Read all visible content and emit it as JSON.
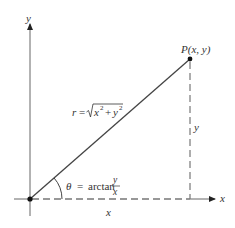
{
  "diagram": {
    "axes": {
      "x_label": "x",
      "y_label": "y"
    },
    "point": {
      "label": "P(x, y)"
    },
    "radius": {
      "lhs": "r",
      "eq": "=",
      "radicand_x": "x",
      "radicand_y": "y",
      "plus": "+",
      "exp": "2"
    },
    "angle": {
      "symbol": "θ",
      "eq": "=",
      "func": "arctan",
      "numerator": "y",
      "denominator": "x"
    },
    "legs": {
      "horizontal_label": "x",
      "vertical_label": "y"
    },
    "colors": {
      "line": "#444444",
      "axis": "#666666",
      "dash": "#777777",
      "point": "#111111",
      "text": "#333333"
    }
  }
}
